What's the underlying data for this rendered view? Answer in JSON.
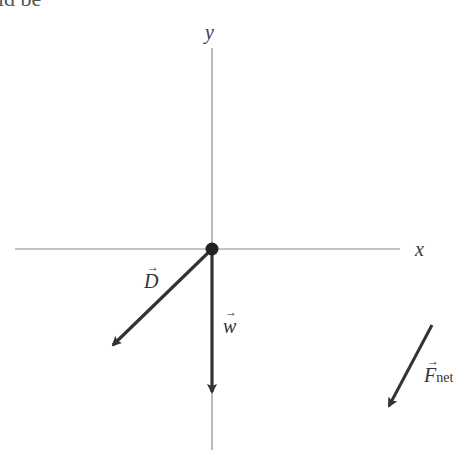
{
  "fragment_text": "ld be",
  "axes": {
    "x_label": "x",
    "y_label": "y"
  },
  "vectors": [
    {
      "id": "D",
      "label": "D",
      "subscript": "",
      "from": [
        212,
        249
      ],
      "to": [
        111,
        347
      ]
    },
    {
      "id": "w",
      "label": "w",
      "subscript": "",
      "from": [
        212,
        249
      ],
      "to": [
        212,
        394
      ]
    },
    {
      "id": "Fnet",
      "label": "F",
      "subscript": "net",
      "from": [
        432,
        325
      ],
      "to": [
        388,
        408
      ]
    }
  ],
  "colors": {
    "axis": "#8a8a8a",
    "vector": "#333333",
    "origin": "#222222"
  },
  "arrow_glyph": "→"
}
